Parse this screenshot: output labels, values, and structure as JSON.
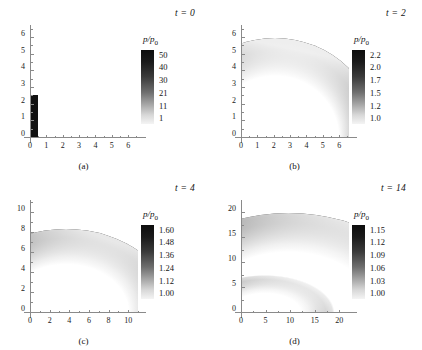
{
  "figure": {
    "background": "#ffffff",
    "colormap_high": "#0d0d0d",
    "colormap_low": "#f4f4f4"
  },
  "panels": [
    {
      "tag": "(a)",
      "time_label": "t = 0",
      "colorbar": {
        "title_num": "p",
        "title_den": "p",
        "title_sub": "0",
        "ticks": [
          "50",
          "40",
          "30",
          "21",
          "11",
          "1"
        ]
      },
      "axes": {
        "x_ticks": [
          "0",
          "1",
          "2",
          "3",
          "4",
          "5",
          "6"
        ],
        "y_ticks": [
          "0",
          "1",
          "2",
          "3",
          "4",
          "5",
          "6"
        ],
        "xlim": [
          0,
          6.6
        ],
        "ylim": [
          0,
          6.6
        ]
      }
    },
    {
      "tag": "(b)",
      "time_label": "t = 2",
      "colorbar": {
        "title_num": "p",
        "title_den": "p",
        "title_sub": "0",
        "ticks": [
          "2.2",
          "2.0",
          "1.7",
          "1.5",
          "1.2",
          "1.0"
        ]
      },
      "axes": {
        "x_ticks": [
          "0",
          "1",
          "2",
          "3",
          "4",
          "5",
          "6"
        ],
        "y_ticks": [
          "0",
          "1",
          "2",
          "3",
          "4",
          "5",
          "6"
        ],
        "xlim": [
          0,
          6.6
        ],
        "ylim": [
          0,
          6.6
        ]
      }
    },
    {
      "tag": "(c)",
      "time_label": "t = 4",
      "colorbar": {
        "title_num": "p",
        "title_den": "p",
        "title_sub": "0",
        "ticks": [
          "1.60",
          "1.48",
          "1.36",
          "1.24",
          "1.12",
          "1.00"
        ]
      },
      "axes": {
        "x_ticks": [
          "0",
          "2",
          "4",
          "6",
          "8",
          "10"
        ],
        "y_ticks": [
          "0",
          "2",
          "4",
          "6",
          "8",
          "10"
        ],
        "xlim": [
          0,
          11
        ],
        "ylim": [
          0,
          11
        ]
      }
    },
    {
      "tag": "(d)",
      "time_label": "t = 14",
      "colorbar": {
        "title_num": "p",
        "title_den": "p",
        "title_sub": "0",
        "ticks": [
          "1.15",
          "1.12",
          "1.09",
          "1.06",
          "1.03",
          "1.00"
        ]
      },
      "axes": {
        "x_ticks": [
          "0",
          "5",
          "10",
          "15",
          "20"
        ],
        "y_ticks": [
          "0",
          "5",
          "10",
          "15",
          "20"
        ],
        "xlim": [
          0,
          22
        ],
        "ylim": [
          0,
          22
        ]
      }
    }
  ],
  "chart_data": {
    "type": "heatmap",
    "title": "",
    "xlabel": "",
    "ylabel": "",
    "quantity": "p/p0",
    "panels": [
      {
        "tag": "(a)",
        "t": 0,
        "xlim": [
          0,
          6.6
        ],
        "ylim": [
          0,
          6.6
        ],
        "x_ticks": [
          0,
          1,
          2,
          3,
          4,
          5,
          6
        ],
        "y_ticks": [
          0,
          1,
          2,
          3,
          4,
          5,
          6
        ],
        "colorbar_ticks": [
          50,
          40,
          30,
          21,
          11,
          1
        ],
        "colorbar_range": [
          1,
          50
        ],
        "features": [
          {
            "shape": "rectangle",
            "x_range": [
              0,
              0.5
            ],
            "y_range": [
              0,
              2.6
            ],
            "value": 50,
            "note": "initial high-pressure slab at the axis"
          }
        ]
      },
      {
        "tag": "(b)",
        "t": 2,
        "xlim": [
          0,
          6.6
        ],
        "ylim": [
          0,
          6.6
        ],
        "x_ticks": [
          0,
          1,
          2,
          3,
          4,
          5,
          6
        ],
        "y_ticks": [
          0,
          1,
          2,
          3,
          4,
          5,
          6
        ],
        "colorbar_ticks": [
          2.2,
          2.0,
          1.7,
          1.5,
          1.2,
          1.0
        ],
        "colorbar_range": [
          1.0,
          2.2
        ],
        "features": [
          {
            "shape": "quarter-annulus",
            "outer_radius_x": 4.2,
            "outer_radius_y": 6.0,
            "inner_radius_x": 2.5,
            "inner_radius_y": 4.6,
            "peak_value": 2.2,
            "peak_location": [
              4.0,
              0.0
            ],
            "note": "shock front strongest along the x-axis, weakening toward the y-axis"
          }
        ]
      },
      {
        "tag": "(c)",
        "t": 4,
        "xlim": [
          0,
          11
        ],
        "ylim": [
          0,
          11
        ],
        "x_ticks": [
          0,
          2,
          4,
          6,
          8,
          10
        ],
        "y_ticks": [
          0,
          2,
          4,
          6,
          8,
          10
        ],
        "colorbar_ticks": [
          1.6,
          1.48,
          1.36,
          1.24,
          1.12,
          1.0
        ],
        "colorbar_range": [
          1.0,
          1.6
        ],
        "features": [
          {
            "shape": "quarter-annulus",
            "outer_radius_x": 7.3,
            "outer_radius_y": 8.4,
            "inner_radius_x": 5.4,
            "inner_radius_y": 6.9,
            "peak_value": 1.6,
            "peak_location": [
              7.0,
              0.0
            ],
            "note": "shock front broadened and weakened as it expands"
          }
        ]
      },
      {
        "tag": "(d)",
        "t": 14,
        "xlim": [
          0,
          22
        ],
        "ylim": [
          0,
          22
        ],
        "x_ticks": [
          0,
          5,
          10,
          15,
          20
        ],
        "y_ticks": [
          0,
          5,
          10,
          15,
          20
        ],
        "colorbar_ticks": [
          1.15,
          1.12,
          1.09,
          1.06,
          1.03,
          1.0
        ],
        "colorbar_range": [
          1.0,
          1.15
        ],
        "features": [
          {
            "shape": "quarter-annulus",
            "outer_radius_x": 19.3,
            "outer_radius_y": 20.0,
            "inner_radius_x": 16.0,
            "inner_radius_y": 17.2,
            "peak_value": 1.15,
            "peak_location": [
              19.0,
              0.0
            ],
            "note": "primary shock front"
          },
          {
            "shape": "quarter-annulus",
            "outer_radius_x": 9.5,
            "outer_radius_y": 7.6,
            "inner_radius_x": 5.6,
            "inner_radius_y": 4.4,
            "peak_value": 1.05,
            "peak_location": [
              8.0,
              0.0
            ],
            "note": "diffuse secondary inner wave"
          }
        ]
      }
    ]
  }
}
